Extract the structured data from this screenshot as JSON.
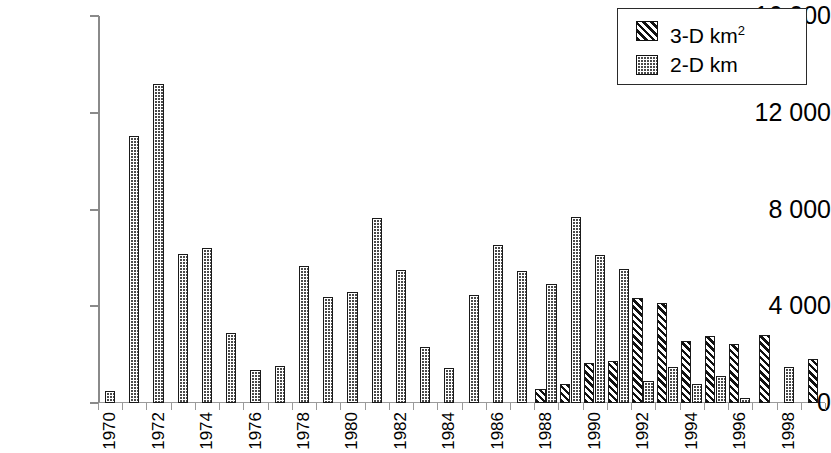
{
  "chart_data": {
    "type": "bar",
    "title": "",
    "xlabel": "",
    "ylabel": "",
    "ylim": [
      0,
      16000
    ],
    "ytick_values": [
      0,
      4000,
      8000,
      12000,
      16000
    ],
    "ytick_labels": [
      "0",
      "4 000",
      "8 000",
      "12 000",
      "16 000"
    ],
    "grid": false,
    "legend_position": "top-right",
    "categories": [
      "1970",
      "1971",
      "1972",
      "1973",
      "1974",
      "1975",
      "1976",
      "1977",
      "1978",
      "1979",
      "1980",
      "1981",
      "1982",
      "1983",
      "1984",
      "1985",
      "1986",
      "1987",
      "1988",
      "1989",
      "1990",
      "1991",
      "1992",
      "1993",
      "1994",
      "1995",
      "1996",
      "1997",
      "1998",
      "1999"
    ],
    "xtick_labels_shown": [
      "1970",
      "",
      "1972",
      "",
      "1974",
      "",
      "1976",
      "",
      "1978",
      "",
      "1980",
      "",
      "1982",
      "",
      "1984",
      "",
      "1986",
      "",
      "1988",
      "",
      "1990",
      "",
      "1992",
      "",
      "1994",
      "",
      "1996",
      "",
      "1998",
      ""
    ],
    "series": [
      {
        "name": "3-D km²",
        "pattern": "diagonal-hatch",
        "values": [
          0,
          0,
          0,
          0,
          0,
          0,
          0,
          0,
          0,
          0,
          0,
          0,
          0,
          0,
          0,
          0,
          0,
          0,
          600,
          800,
          1650,
          1750,
          4350,
          4150,
          2550,
          2750,
          2450,
          2800,
          0,
          1800
        ]
      },
      {
        "name": "2-D km",
        "pattern": "dotted",
        "values": [
          500,
          11050,
          13200,
          6150,
          6400,
          2900,
          1350,
          1550,
          5650,
          4400,
          4600,
          7650,
          5500,
          2300,
          1450,
          4450,
          6550,
          5450,
          4900,
          7700,
          6100,
          5550,
          900,
          1500,
          800,
          1100,
          200,
          0,
          1500,
          0
        ]
      }
    ]
  },
  "legend": {
    "entries": [
      {
        "label_main": "3-D km",
        "label_sup": "2",
        "swatch": "diagonal-hatch-swatch"
      },
      {
        "label_main": "2-D km",
        "label_sup": "",
        "swatch": "dotted-swatch"
      }
    ]
  }
}
